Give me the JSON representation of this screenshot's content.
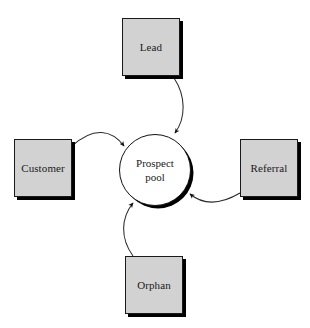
{
  "diagram": {
    "type": "hub-and-spoke",
    "background_color": "#ffffff",
    "node_fill_color": "#d2d2d2",
    "hub_fill_color": "#ffffff",
    "stroke_color": "#1a1a1a",
    "shadow_color": "#000000",
    "hub": {
      "label": "Prospect\npool",
      "shape": "circle"
    },
    "nodes": [
      {
        "id": "lead",
        "label": "Lead",
        "shape": "rectangle",
        "position": "top"
      },
      {
        "id": "customer",
        "label": "Customer",
        "shape": "rectangle",
        "position": "left"
      },
      {
        "id": "referral",
        "label": "Referral",
        "shape": "rectangle",
        "position": "right"
      },
      {
        "id": "orphan",
        "label": "Orphan",
        "shape": "rectangle",
        "position": "bottom"
      }
    ],
    "edges": [
      {
        "from": "lead",
        "to": "hub",
        "style": "curved-arrow",
        "direction": "inbound"
      },
      {
        "from": "customer",
        "to": "hub",
        "style": "curved-arrow",
        "direction": "inbound"
      },
      {
        "from": "referral",
        "to": "hub",
        "style": "curved-arrow",
        "direction": "inbound"
      },
      {
        "from": "orphan",
        "to": "hub",
        "style": "curved-arrow",
        "direction": "inbound"
      }
    ]
  }
}
